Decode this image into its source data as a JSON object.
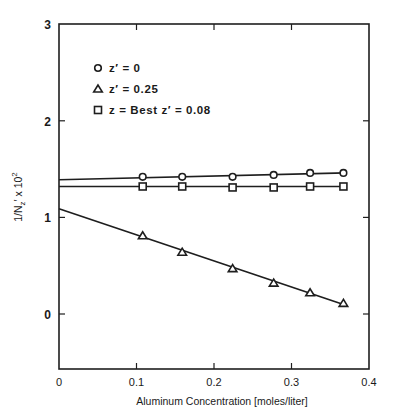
{
  "chart_data": {
    "type": "line",
    "title": "",
    "xlabel": "Aluminum Concentration [moles/liter]",
    "ylabel": "1/N_z' x 10^2",
    "ylabel_parts": {
      "main": "1/N",
      "sub": "z",
      "prime": "′",
      "mult": " x 10",
      "sup": "2"
    },
    "xlim": [
      0,
      0.4
    ],
    "ylim": [
      -0.57,
      3
    ],
    "xticks": [
      0,
      0.1,
      0.2,
      0.3,
      0.4
    ],
    "xtick_labels": [
      "0",
      "0.1",
      "0.2",
      "0.3",
      "0.4"
    ],
    "yticks": [
      0,
      1,
      2,
      3
    ],
    "ytick_labels": [
      "0",
      "1",
      "2",
      "3"
    ],
    "grid": false,
    "legend_position": "upper-left inside",
    "series": [
      {
        "name": "z' = 0",
        "label": "z′ = 0",
        "marker": "circle",
        "fit_line": {
          "x": [
            0,
            0.37
          ],
          "y": [
            1.39,
            1.46
          ]
        },
        "x": [
          0.108,
          0.159,
          0.224,
          0.277,
          0.324,
          0.367
        ],
        "y": [
          1.42,
          1.42,
          1.42,
          1.44,
          1.46,
          1.46
        ]
      },
      {
        "name": "z' = 0.25",
        "label": "z′ = 0.25",
        "marker": "triangle",
        "fit_line": {
          "x": [
            0,
            0.37
          ],
          "y": [
            1.09,
            0.09
          ]
        },
        "x": [
          0.108,
          0.159,
          0.224,
          0.277,
          0.324,
          0.367
        ],
        "y": [
          0.81,
          0.64,
          0.47,
          0.32,
          0.22,
          0.11
        ]
      },
      {
        "name": "z = Best z' = 0.08",
        "label": "z  = Best z′ = 0.08",
        "marker": "square",
        "fit_line": {
          "x": [
            0,
            0.37
          ],
          "y": [
            1.32,
            1.32
          ]
        },
        "x": [
          0.108,
          0.159,
          0.224,
          0.277,
          0.324,
          0.367
        ],
        "y": [
          1.32,
          1.32,
          1.31,
          1.31,
          1.32,
          1.32
        ]
      }
    ]
  }
}
